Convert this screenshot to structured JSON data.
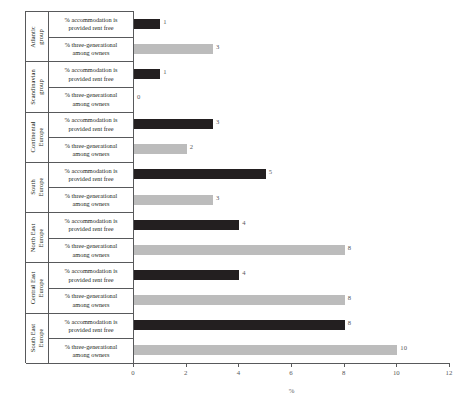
{
  "chart_data": {
    "type": "bar",
    "orientation": "horizontal",
    "title": "",
    "xlabel": "%",
    "ylabel": "",
    "xlim": [
      0,
      12
    ],
    "xticks": [
      0,
      2,
      4,
      6,
      8,
      10,
      12
    ],
    "grid": false,
    "legend": "none",
    "series": [
      {
        "name": "% accommodation is provided rent free",
        "color": "#231f20",
        "values": [
          1,
          1,
          3,
          5,
          4,
          4,
          8
        ]
      },
      {
        "name": "% three-generational among owners",
        "color": "#bcbcbc",
        "values": [
          3,
          0,
          2,
          3,
          8,
          8,
          10
        ]
      }
    ],
    "categories": [
      "Atlantic group",
      "Scandinavian group",
      "Continental Europe",
      "South Europe",
      "North East Europe",
      "Central East Europe",
      "South East Europe"
    ]
  },
  "axis": {
    "x_title": "%",
    "ticks": [
      {
        "value": 0,
        "label": "0"
      },
      {
        "value": 2,
        "label": "2"
      },
      {
        "value": 4,
        "label": "4"
      },
      {
        "value": 6,
        "label": "6"
      },
      {
        "value": 8,
        "label": "8"
      },
      {
        "value": 10,
        "label": "10"
      },
      {
        "value": 12,
        "label": "12"
      }
    ]
  },
  "row_labels": {
    "rent_free_line1": "% accommodation is",
    "rent_free_line2": "provided rent free",
    "three_gen_line1": "% three-generational",
    "three_gen_line2": "among owners"
  },
  "groups": [
    {
      "id": "atlantic",
      "label_line1": "Atlantic",
      "label_line2": "group",
      "rows": [
        {
          "series": "rent_free",
          "value_label": "1",
          "value": 1
        },
        {
          "series": "three_gen",
          "value_label": "3",
          "value": 3
        }
      ]
    },
    {
      "id": "scandinavian",
      "label_line1": "Scandinavian",
      "label_line2": "group",
      "rows": [
        {
          "series": "rent_free",
          "value_label": "1",
          "value": 1
        },
        {
          "series": "three_gen",
          "value_label": "0",
          "value": 0
        }
      ]
    },
    {
      "id": "continental-europe",
      "label_line1": "Continental",
      "label_line2": "Europe",
      "rows": [
        {
          "series": "rent_free",
          "value_label": "3",
          "value": 3
        },
        {
          "series": "three_gen",
          "value_label": "2",
          "value": 2
        }
      ]
    },
    {
      "id": "south-europe",
      "label_line1": "South",
      "label_line2": "Europe",
      "rows": [
        {
          "series": "rent_free",
          "value_label": "5",
          "value": 5
        },
        {
          "series": "three_gen",
          "value_label": "3",
          "value": 3
        }
      ]
    },
    {
      "id": "north-east-europe",
      "label_line1": "North East",
      "label_line2": "Europe",
      "rows": [
        {
          "series": "rent_free",
          "value_label": "4",
          "value": 4
        },
        {
          "series": "three_gen",
          "value_label": "8",
          "value": 8
        }
      ]
    },
    {
      "id": "central-east-europe",
      "label_line1": "Central East",
      "label_line2": "Europe",
      "rows": [
        {
          "series": "rent_free",
          "value_label": "4",
          "value": 4
        },
        {
          "series": "three_gen",
          "value_label": "8",
          "value": 8
        }
      ]
    },
    {
      "id": "south-east-europe",
      "label_line1": "South East",
      "label_line2": "Europe",
      "rows": [
        {
          "series": "rent_free",
          "value_label": "8",
          "value": 8
        },
        {
          "series": "three_gen",
          "value_label": "10",
          "value": 10
        }
      ]
    }
  ],
  "colors": {
    "dark_series": "#231f20",
    "light_series": "#bcbcbc",
    "axis": "#58595b",
    "background": "#ffffff"
  }
}
